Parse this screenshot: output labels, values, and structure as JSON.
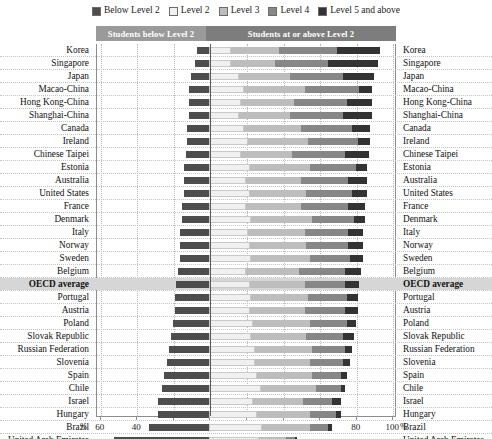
{
  "legend": {
    "items": [
      {
        "label": "Below Level 2",
        "color": "#4d4d4d"
      },
      {
        "label": "Level 2",
        "color": "#f0f0f0"
      },
      {
        "label": "Level 3",
        "color": "#bdbdbd"
      },
      {
        "label": "Level 4",
        "color": "#878787"
      },
      {
        "label": "Level 5 and above",
        "color": "#333333"
      }
    ]
  },
  "header": {
    "below_label": "Students below Level 2",
    "above_label": "Students at or above Level 2",
    "below_color": "#9a9a9a",
    "above_color": "#7d7d7d"
  },
  "axis": {
    "left_unit": "%",
    "right_unit": "%",
    "ticks": [
      {
        "label": "60",
        "value": -60
      },
      {
        "label": "40",
        "value": -40
      },
      {
        "label": "20",
        "value": -20
      },
      {
        "label": "0",
        "value": 0
      },
      {
        "label": "20",
        "value": 20
      },
      {
        "label": "40",
        "value": 40
      },
      {
        "label": "60",
        "value": 60
      },
      {
        "label": "80",
        "value": 80
      },
      {
        "label": "100",
        "value": 100
      }
    ],
    "min": -62,
    "max": 102
  },
  "chart_data": {
    "type": "bar",
    "orientation": "horizontal",
    "stacked": true,
    "diverging": true,
    "title": "",
    "xlabel": "%",
    "ylabel": "",
    "xlim": [
      -62,
      102
    ],
    "grid": true,
    "legend_position": "top",
    "series": [
      {
        "name": "Below Level 2",
        "color": "#4d4d4d",
        "side": "left"
      },
      {
        "name": "Level 2",
        "color": "#f0f0f0",
        "side": "right"
      },
      {
        "name": "Level 3",
        "color": "#bdbdbd",
        "side": "right"
      },
      {
        "name": "Level 4",
        "color": "#878787",
        "side": "right"
      },
      {
        "name": "Level 5 and above",
        "color": "#333333",
        "side": "right"
      }
    ],
    "categories": [
      "Korea",
      "Singapore",
      "Japan",
      "Macao-China",
      "Hong Kong-China",
      "Shanghai-China",
      "Canada",
      "Ireland",
      "Chinese Taipei",
      "Estonia",
      "Australia",
      "United States",
      "France",
      "Denmark",
      "Italy",
      "Norway",
      "Sweden",
      "Belgium",
      "OECD average",
      "Portugal",
      "Austria",
      "Poland",
      "Slovak Republic",
      "Russian Federation",
      "Slovenia",
      "Spain",
      "Chile",
      "Israel",
      "Hungary",
      "Brazil",
      "United Arab Emirates",
      "Colombia"
    ],
    "rows": [
      {
        "country": "Korea",
        "below": 7,
        "l2": 12,
        "l3": 26,
        "l4": 32,
        "l5": 23
      },
      {
        "country": "Singapore",
        "below": 8,
        "l2": 12,
        "l3": 24,
        "l4": 29,
        "l5": 27
      },
      {
        "country": "Japan",
        "below": 10,
        "l2": 16,
        "l3": 28,
        "l4": 29,
        "l5": 17
      },
      {
        "country": "Macao-China",
        "below": 11,
        "l2": 19,
        "l3": 33,
        "l4": 30,
        "l5": 7
      },
      {
        "country": "Hong Kong-China",
        "below": 11,
        "l2": 17,
        "l3": 29,
        "l4": 29,
        "l5": 14
      },
      {
        "country": "Shanghai-China",
        "below": 11,
        "l2": 16,
        "l3": 28,
        "l4": 29,
        "l5": 16
      },
      {
        "country": "Canada",
        "below": 12,
        "l2": 19,
        "l3": 31,
        "l4": 28,
        "l5": 10
      },
      {
        "country": "Ireland",
        "below": 12,
        "l2": 21,
        "l3": 33,
        "l4": 27,
        "l5": 7
      },
      {
        "country": "Chinese Taipei",
        "below": 13,
        "l2": 17,
        "l3": 28,
        "l4": 29,
        "l5": 13
      },
      {
        "country": "Estonia",
        "below": 14,
        "l2": 22,
        "l3": 33,
        "l4": 25,
        "l5": 6
      },
      {
        "country": "Australia",
        "below": 14,
        "l2": 20,
        "l3": 30,
        "l4": 26,
        "l5": 10
      },
      {
        "country": "United States",
        "below": 14,
        "l2": 22,
        "l3": 31,
        "l4": 25,
        "l5": 8
      },
      {
        "country": "France",
        "below": 15,
        "l2": 20,
        "l3": 30,
        "l4": 26,
        "l5": 9
      },
      {
        "country": "Denmark",
        "below": 15,
        "l2": 23,
        "l3": 33,
        "l4": 23,
        "l5": 6
      },
      {
        "country": "Italy",
        "below": 16,
        "l2": 21,
        "l3": 31,
        "l4": 24,
        "l5": 8
      },
      {
        "country": "Norway",
        "below": 16,
        "l2": 22,
        "l3": 31,
        "l4": 23,
        "l5": 8
      },
      {
        "country": "Sweden",
        "below": 16,
        "l2": 23,
        "l3": 32,
        "l4": 22,
        "l5": 7
      },
      {
        "country": "Belgium",
        "below": 17,
        "l2": 20,
        "l3": 29,
        "l4": 25,
        "l5": 9
      },
      {
        "country": "OECD average",
        "below": 18,
        "l2": 22,
        "l3": 30,
        "l4": 22,
        "l5": 8
      },
      {
        "country": "Portugal",
        "below": 19,
        "l2": 23,
        "l3": 31,
        "l4": 21,
        "l5": 6
      },
      {
        "country": "Austria",
        "below": 19,
        "l2": 22,
        "l3": 30,
        "l4": 22,
        "l5": 7
      },
      {
        "country": "Poland",
        "below": 20,
        "l2": 24,
        "l3": 31,
        "l4": 20,
        "l5": 5
      },
      {
        "country": "Slovak Republic",
        "below": 21,
        "l2": 23,
        "l3": 30,
        "l4": 20,
        "l5": 6
      },
      {
        "country": "Russian Federation",
        "below": 22,
        "l2": 25,
        "l3": 31,
        "l4": 18,
        "l5": 4
      },
      {
        "country": "Slovenia",
        "below": 23,
        "l2": 25,
        "l3": 30,
        "l4": 18,
        "l5": 4
      },
      {
        "country": "Spain",
        "below": 25,
        "l2": 26,
        "l3": 30,
        "l4": 16,
        "l5": 3
      },
      {
        "country": "Chile",
        "below": 26,
        "l2": 28,
        "l3": 30,
        "l4": 14,
        "l5": 2
      },
      {
        "country": "Israel",
        "below": 28,
        "l2": 24,
        "l3": 27,
        "l4": 16,
        "l5": 5
      },
      {
        "country": "Hungary",
        "below": 28,
        "l2": 26,
        "l3": 29,
        "l4": 14,
        "l5": 3
      },
      {
        "country": "Brazil",
        "below": 33,
        "l2": 29,
        "l3": 26,
        "l4": 10,
        "l5": 2
      },
      {
        "country": "United Arab Emirates",
        "below": 52,
        "l2": 27,
        "l3": 15,
        "l4": 5,
        "l5": 1
      },
      {
        "country": "Colombia",
        "below": 58,
        "l2": 27,
        "l3": 12,
        "l4": 3,
        "l5": 0
      }
    ]
  }
}
